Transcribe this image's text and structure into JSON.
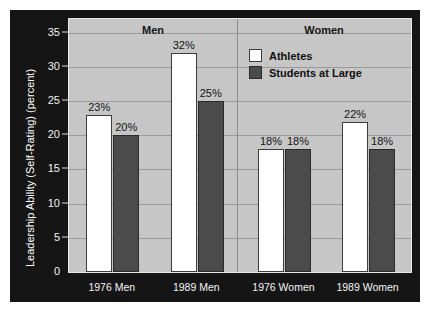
{
  "chart_data": {
    "type": "bar",
    "title": "",
    "xlabel": "",
    "ylabel": "Leadership Ability (Self-Rating) (percent)",
    "ylim": [
      0,
      37
    ],
    "yticks": [
      0,
      5,
      10,
      15,
      20,
      25,
      30,
      35
    ],
    "ytick_labels": [
      "0",
      "5",
      "10",
      "15",
      "20",
      "25",
      "30",
      "35"
    ],
    "grid": true,
    "legend_position": "top-right-inside",
    "categories": [
      "1976 Men",
      "1989 Men",
      "1976 Women",
      "1989 Women"
    ],
    "group_headers": [
      "Men",
      "Women"
    ],
    "series": [
      {
        "name": "Athletes",
        "color": "#ffffff",
        "values": [
          23,
          32,
          18,
          22
        ],
        "labels": [
          "23%",
          "32%",
          "18%",
          "22%"
        ]
      },
      {
        "name": "Students at Large",
        "color": "#4b4b4b",
        "values": [
          20,
          25,
          18,
          18
        ],
        "labels": [
          "20%",
          "25%",
          "18%",
          "18%"
        ]
      }
    ]
  },
  "axis": {
    "y_title": "Leadership Ability (Self-Rating) (percent)",
    "ticks": [
      "35",
      "30",
      "25",
      "20",
      "15",
      "10",
      "5",
      "0"
    ]
  },
  "groups": [
    {
      "header": "Men"
    },
    {
      "header": "Women"
    }
  ],
  "categories": [
    {
      "label": "1976 Men"
    },
    {
      "label": "1989 Men"
    },
    {
      "label": "1976 Women"
    },
    {
      "label": "1989 Women"
    }
  ],
  "legend": {
    "items": [
      {
        "label": "Athletes",
        "color": "#ffffff"
      },
      {
        "label": "Students at Large",
        "color": "#4b4b4b"
      }
    ]
  },
  "bar_labels": {
    "g1_athletes": "23%",
    "g1_students": "20%",
    "g2_athletes": "32%",
    "g2_students": "25%",
    "g3_athletes": "18%",
    "g3_students": "18%",
    "g4_athletes": "22%",
    "g4_students": "18%"
  },
  "colors": {
    "panel_background": "#151515",
    "plot_background": "#c6c6c6",
    "gridline": "#9a9a9a",
    "athletes_bar": "#ffffff",
    "students_bar": "#4b4b4b",
    "axis_text": "#f2f2f2"
  }
}
